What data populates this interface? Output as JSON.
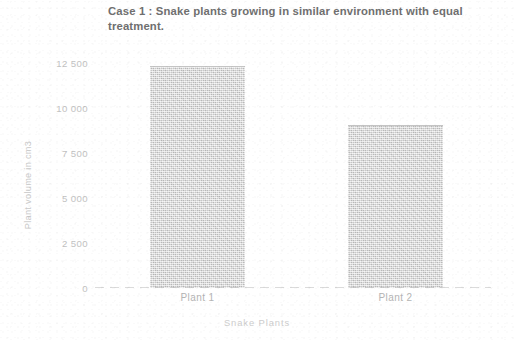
{
  "chart_data": {
    "type": "bar",
    "title": "Case 1 : Snake plants growing in similar environment with equal treatment.",
    "xlabel": "Snake Plants",
    "ylabel": "Plant volume in cm3",
    "categories": [
      "Plant 1",
      "Plant 2"
    ],
    "values": [
      12300,
      9000
    ],
    "ylim": [
      0,
      13500
    ],
    "yticks": [
      0,
      2500,
      5000,
      7500,
      10000,
      12500
    ],
    "ytick_labels": [
      "0",
      "2 500",
      "5 000",
      "7 500",
      "10 000",
      "12 500"
    ],
    "grid": false,
    "legend": null,
    "bar_color": "#d2d2d2",
    "text_color": "#8d8d8d"
  }
}
